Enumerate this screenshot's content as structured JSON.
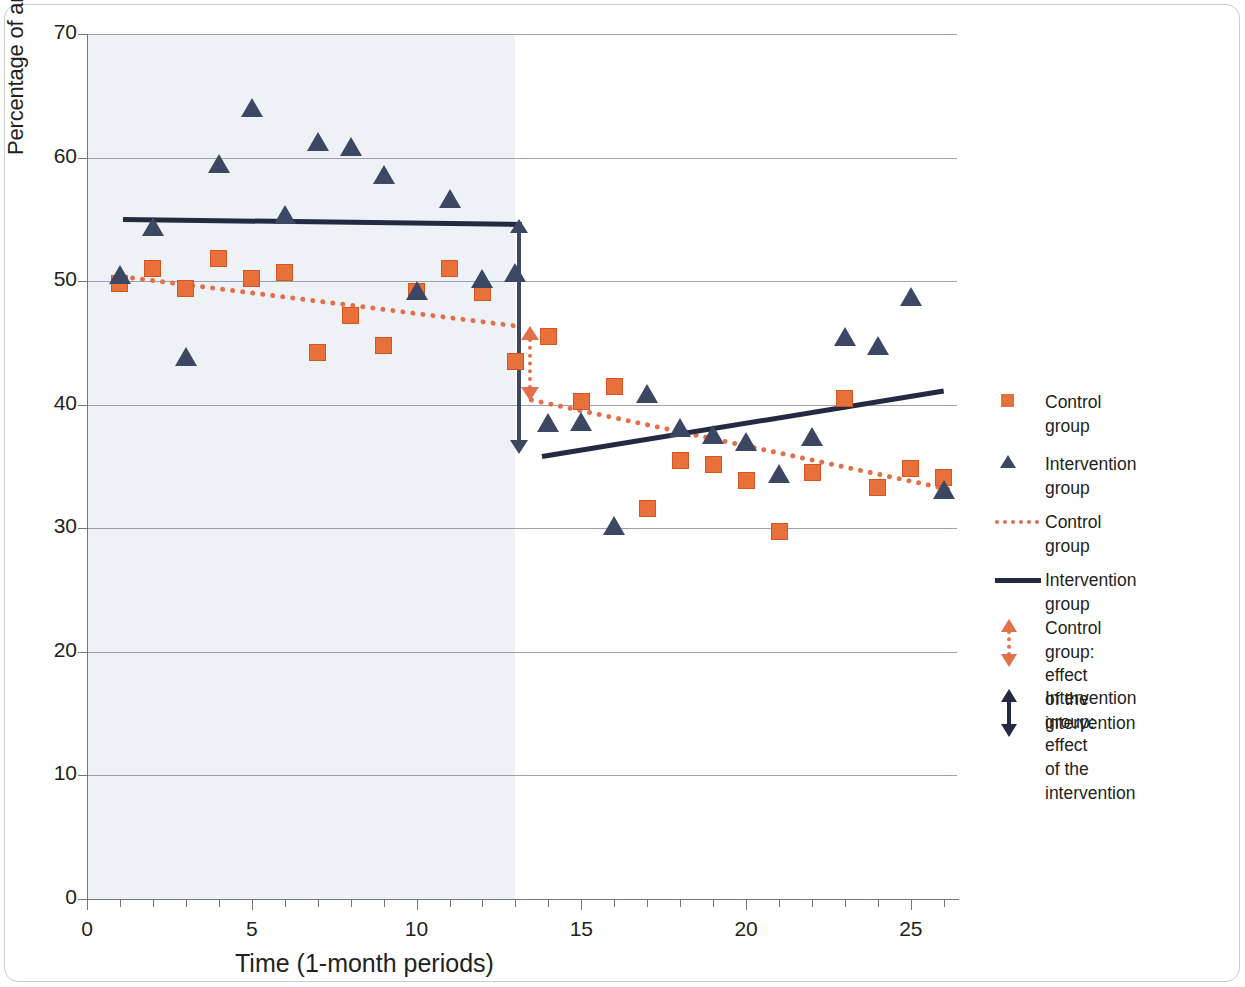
{
  "chart_data": {
    "type": "scatter",
    "title": "",
    "xlabel": "Time (1-month periods)",
    "ylabel": "Percentage of antimibrobial prescriptions>72h (%)",
    "xlim": [
      0,
      26.4
    ],
    "ylim": [
      0,
      70
    ],
    "xticks": [
      0,
      5,
      10,
      15,
      20,
      25
    ],
    "yticks": [
      0,
      10,
      20,
      30,
      40,
      50,
      60,
      70
    ],
    "grid": "horizontal",
    "legend_position": "right",
    "intervention_period": 13,
    "shaded_region": {
      "label": "pre-intervention",
      "from": 0,
      "to": 13,
      "color": "#eef2f6"
    },
    "series": [
      {
        "name": "Control group",
        "marker": "square",
        "color": "#e8703a",
        "x": [
          1,
          2,
          3,
          4,
          5,
          6,
          7,
          8,
          9,
          10,
          11,
          12,
          13,
          14,
          15,
          16,
          17,
          18,
          19,
          20,
          21,
          22,
          23,
          24,
          25,
          26
        ],
        "values": [
          49.8,
          51.0,
          49.4,
          51.8,
          50.2,
          50.7,
          44.2,
          47.2,
          44.8,
          49.2,
          51.0,
          49.1,
          43.5,
          45.5,
          40.3,
          41.5,
          31.6,
          35.5,
          35.2,
          33.9,
          29.7,
          34.5,
          40.5,
          33.3,
          34.8,
          34.1
        ]
      },
      {
        "name": "Intervention group",
        "marker": "triangle",
        "color": "#3c4763",
        "x": [
          1,
          2,
          3,
          4,
          5,
          6,
          7,
          8,
          9,
          10,
          11,
          12,
          13,
          14,
          15,
          16,
          17,
          18,
          19,
          20,
          21,
          22,
          23,
          24,
          25,
          26
        ],
        "values": [
          50.4,
          54.3,
          43.8,
          59.4,
          63.9,
          55.3,
          61.2,
          60.8,
          58.5,
          49.1,
          56.6,
          50.1,
          50.6,
          38.4,
          38.5,
          30.1,
          40.8,
          38.0,
          37.5,
          36.9,
          34.3,
          37.3,
          45.4,
          44.7,
          48.6,
          33.0
        ]
      }
    ],
    "trendlines": [
      {
        "name": "Control group",
        "style": "dotted",
        "color": "#e0714a",
        "segment": "pre",
        "x0": 1,
        "y0": 50.6,
        "x1": 13,
        "y1": 46.6
      },
      {
        "name": "Control group",
        "style": "dotted",
        "color": "#e0714a",
        "segment": "post",
        "x0": 13.4,
        "y0": 40.6,
        "x1": 26.2,
        "y1": 33.3
      },
      {
        "name": "Intervention group",
        "style": "solid",
        "color": "#232b42",
        "segment": "pre",
        "x0": 1.1,
        "y0": 55.2,
        "x1": 13.2,
        "y1": 54.8
      },
      {
        "name": "Intervention group",
        "style": "solid",
        "color": "#232b42",
        "segment": "post",
        "x0": 13.8,
        "y0": 36.0,
        "x1": 26.0,
        "y1": 41.3
      }
    ],
    "effect_arrows": [
      {
        "name": "Intervention group: effect of the intervention",
        "color": "#3c4763",
        "style": "solid",
        "x": 13.1,
        "y_top": 55.0,
        "y_bottom": 36.0
      },
      {
        "name": "Control group: effect of the intervention",
        "color": "#e0714a",
        "style": "dotted",
        "x": 13.45,
        "y_top": 46.4,
        "y_bottom": 40.3
      }
    ]
  },
  "axes": {
    "y_title": "Percentage of antimibrobial prescriptions>72h (%)",
    "x_title": "Time (1-month periods)",
    "y_ticks": [
      "70",
      "60",
      "50",
      "40",
      "30",
      "20",
      "10",
      "0"
    ],
    "x_ticks": [
      "0",
      "5",
      "10",
      "15",
      "20",
      "25"
    ]
  },
  "legend": {
    "items": [
      {
        "id": "control-marker",
        "icon": "square-marker-icon",
        "label": "Control group"
      },
      {
        "id": "intervention-marker",
        "icon": "triangle-marker-icon",
        "label": "Intervention group"
      },
      {
        "id": "control-trend",
        "icon": "dotted-line-icon",
        "label": "Control group"
      },
      {
        "id": "intervention-trend",
        "icon": "solid-line-icon",
        "label": "Intervention group"
      },
      {
        "id": "control-effect",
        "icon": "dotted-double-arrow-icon",
        "label": "Control group: effect\nof the intervention"
      },
      {
        "id": "intervention-effect",
        "icon": "solid-double-arrow-icon",
        "label": "Intervention group: effect\nof the intervention"
      }
    ]
  },
  "colors": {
    "control": "#e8703a",
    "intervention": "#3c4763",
    "control_trend": "#e0714a",
    "intervention_trend": "#232b42",
    "shade": "#eef2f6",
    "grid": "#9aa3ad"
  }
}
